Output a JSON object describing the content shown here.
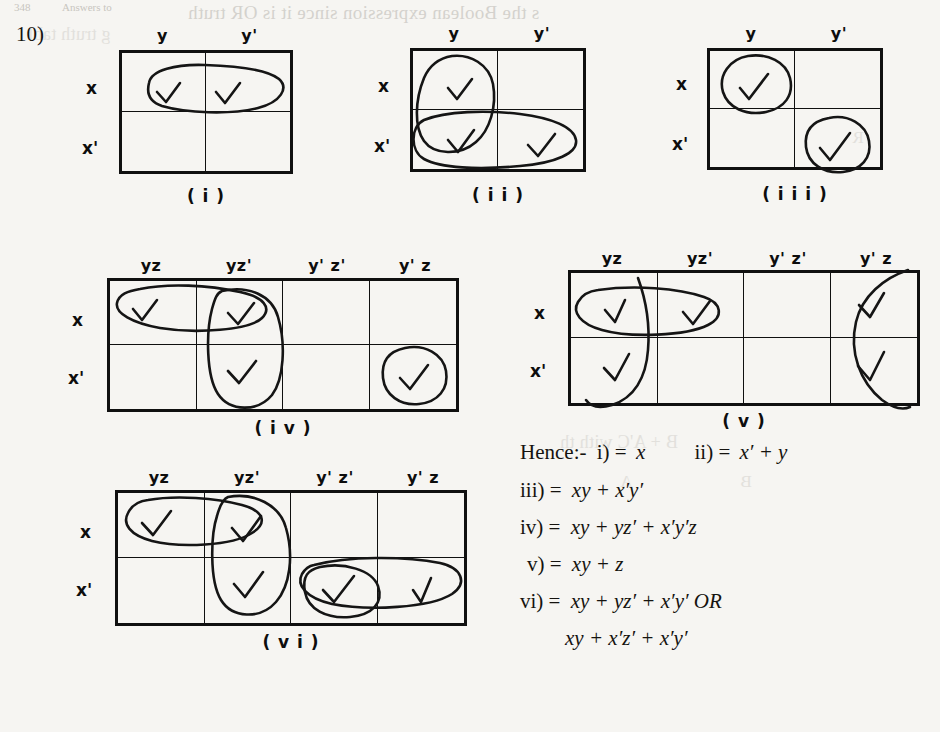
{
  "page": {
    "question_number": "10)",
    "background_color": "#f6f5f2",
    "ink_color": "#101010",
    "bleed_through_top": "s the Boolean expression since it is   OR truth",
    "bleed_through_top2": "g truth tabl",
    "bleed_through_right1": "B + A'C with th",
    "bleed_through_right2": "A",
    "bleed_through_right3": "B",
    "bleed_through_right4": "R",
    "header_left": "348",
    "header_right": "Answers to"
  },
  "kmaps": [
    {
      "id": "i",
      "caption": "( i )",
      "vars": 2,
      "col_headers": [
        "y",
        "y'"
      ],
      "row_headers": [
        "x",
        "x'"
      ],
      "checks": [
        {
          "row": 0,
          "col": 0
        },
        {
          "row": 0,
          "col": 1
        }
      ],
      "groups": [
        {
          "cells": "x row (xy + xy')",
          "shape": "wide-oval"
        }
      ]
    },
    {
      "id": "ii",
      "caption": "( i i )",
      "vars": 2,
      "col_headers": [
        "y",
        "y'"
      ],
      "row_headers": [
        "x",
        "x'"
      ],
      "checks": [
        {
          "row": 0,
          "col": 0
        },
        {
          "row": 1,
          "col": 0
        },
        {
          "row": 1,
          "col": 1
        }
      ],
      "groups": [
        {
          "cells": "y column (xy + x'y)",
          "shape": "tall-oval"
        },
        {
          "cells": "x' row (x'y + x'y')",
          "shape": "wide-oval"
        }
      ]
    },
    {
      "id": "iii",
      "caption": "( i i i )",
      "vars": 2,
      "col_headers": [
        "y",
        "y'"
      ],
      "row_headers": [
        "x",
        "x'"
      ],
      "checks": [
        {
          "row": 0,
          "col": 0
        },
        {
          "row": 1,
          "col": 1
        }
      ],
      "groups": [
        {
          "cells": "xy",
          "shape": "circle"
        },
        {
          "cells": "x'y'",
          "shape": "circle"
        }
      ]
    },
    {
      "id": "iv",
      "caption": "( i v )",
      "vars": 3,
      "col_headers": [
        "yz",
        "yz'",
        "y' z'",
        "y' z"
      ],
      "row_headers": [
        "x",
        "x'"
      ],
      "checks": [
        {
          "row": 0,
          "col": 0
        },
        {
          "row": 0,
          "col": 1
        },
        {
          "row": 1,
          "col": 1
        },
        {
          "row": 1,
          "col": 3
        }
      ],
      "groups": [
        {
          "cells": "xy (xyz + xyz')",
          "shape": "wide-oval"
        },
        {
          "cells": "yz' (xyz' + x'yz')",
          "shape": "tall-oval"
        },
        {
          "cells": "x'y'z",
          "shape": "circle"
        }
      ]
    },
    {
      "id": "v",
      "caption": "( v )",
      "vars": 3,
      "col_headers": [
        "yz",
        "yz'",
        "y' z'",
        "y' z"
      ],
      "row_headers": [
        "x",
        "x'"
      ],
      "checks": [
        {
          "row": 0,
          "col": 0
        },
        {
          "row": 0,
          "col": 1
        },
        {
          "row": 0,
          "col": 3
        },
        {
          "row": 1,
          "col": 0
        },
        {
          "row": 1,
          "col": 3
        }
      ],
      "groups": [
        {
          "cells": "xy (xyz + xyz')",
          "shape": "wide-oval"
        },
        {
          "cells": "z wrap-around (xyz + x'yz + xy'z + x'y'z)",
          "shape": "split-wrap-oval"
        }
      ]
    },
    {
      "id": "vi",
      "caption": "( v i )",
      "vars": 3,
      "col_headers": [
        "yz",
        "yz'",
        "y' z'",
        "y' z"
      ],
      "row_headers": [
        "x",
        "x'"
      ],
      "checks": [
        {
          "row": 0,
          "col": 0
        },
        {
          "row": 0,
          "col": 1
        },
        {
          "row": 1,
          "col": 1
        },
        {
          "row": 1,
          "col": 2
        },
        {
          "row": 1,
          "col": 3
        }
      ],
      "groups": [
        {
          "cells": "xy (xyz + xyz')",
          "shape": "wide-oval"
        },
        {
          "cells": "yz' (xyz' + x'yz')",
          "shape": "tall-oval"
        },
        {
          "cells": "x'y' (x'y'z' + x'y'z)",
          "shape": "wide-oval"
        }
      ]
    }
  ],
  "answers": {
    "hence_label": "Hence:-",
    "lines": [
      {
        "key": "i_label",
        "label": "i) =",
        "expr": "x"
      },
      {
        "key": "ii_label",
        "label": "ii) =",
        "expr": "x′ + y"
      },
      {
        "key": "iii_label",
        "label": "iii) =",
        "expr": "xy + x′y′"
      },
      {
        "key": "iv_label",
        "label": "iv) =",
        "expr": "xy + yz′ + x′y′z"
      },
      {
        "key": "v_label",
        "label": "v) =",
        "expr": "xy + z"
      },
      {
        "key": "vi_label",
        "label": "vi) =",
        "expr": "xy + yz′ + x′y′ OR"
      },
      {
        "key": "vi_alt",
        "label": "",
        "expr": "xy + x′z′ + x′y′"
      }
    ]
  }
}
